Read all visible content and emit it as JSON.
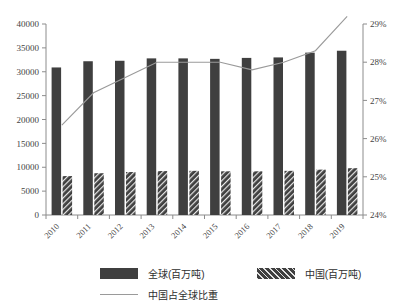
{
  "chart_data": {
    "type": "bar",
    "title": "",
    "xlabel": "",
    "ylabel": "",
    "categories": [
      "2010",
      "2011",
      "2012",
      "2013",
      "2014",
      "2015",
      "2016",
      "2017",
      "2018",
      "2019"
    ],
    "series": [
      {
        "name": "全球(百万吨)",
        "type": "bar",
        "axis": "left",
        "values": [
          30900,
          32200,
          32300,
          32800,
          32800,
          32700,
          32900,
          33000,
          34000,
          34400
        ]
      },
      {
        "name": "中国(百万吨)",
        "type": "bar",
        "axis": "left",
        "values": [
          8150,
          8750,
          9000,
          9200,
          9250,
          9150,
          9150,
          9250,
          9500,
          9800
        ]
      },
      {
        "name": "中国占全球比重",
        "type": "line",
        "axis": "right",
        "values": [
          26.35,
          27.2,
          27.6,
          28.0,
          28.0,
          28.0,
          27.8,
          28.0,
          28.3,
          29.2
        ]
      }
    ],
    "yaxis_left": {
      "min": 0,
      "max": 40000,
      "step": 5000,
      "ticks": [
        "0",
        "5000",
        "10000",
        "15000",
        "20000",
        "25000",
        "30000",
        "35000",
        "40000"
      ]
    },
    "yaxis_right": {
      "min": 24,
      "max": 29,
      "step": 1,
      "ticks": [
        "24%",
        "25%",
        "26%",
        "27%",
        "28%",
        "29%"
      ]
    },
    "grid": false,
    "legend_position": "bottom"
  },
  "legend": {
    "global_label": "全球(百万吨)",
    "china_label": "中国(百万吨)",
    "share_label": "中国占全球比重"
  },
  "colors": {
    "bar_global": "#3f3f3f",
    "bar_china": "#3f3f3f",
    "line_share": "#9a9a9a",
    "axis": "#8c8c8c",
    "text": "#444444"
  }
}
